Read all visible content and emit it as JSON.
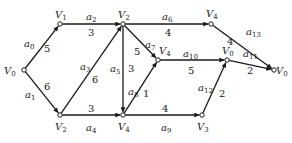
{
  "diagram": {
    "type": "directed-graph",
    "nodes": [
      {
        "id": "n0",
        "label": "V",
        "sub": "0",
        "x": 24,
        "y": 70,
        "lx": 4,
        "ly": 74
      },
      {
        "id": "n1",
        "label": "V",
        "sub": "1",
        "x": 60,
        "y": 24,
        "lx": 55,
        "ly": 18
      },
      {
        "id": "n2",
        "label": "V",
        "sub": "2",
        "x": 123,
        "y": 24,
        "lx": 118,
        "ly": 18
      },
      {
        "id": "n3",
        "label": "V",
        "sub": "4",
        "x": 211,
        "y": 24,
        "lx": 206,
        "ly": 17
      },
      {
        "id": "n4",
        "label": "V",
        "sub": "4",
        "x": 158,
        "y": 60,
        "lx": 159,
        "ly": 54
      },
      {
        "id": "n5",
        "label": "V",
        "sub": "0",
        "x": 227,
        "y": 60,
        "lx": 222,
        "ly": 54
      },
      {
        "id": "n6",
        "label": "V",
        "sub": "0",
        "x": 274,
        "y": 70,
        "lx": 276,
        "ly": 74
      },
      {
        "id": "n7",
        "label": "V",
        "sub": "2",
        "x": 60,
        "y": 115,
        "lx": 55,
        "ly": 130
      },
      {
        "id": "n8",
        "label": "V",
        "sub": "4",
        "x": 123,
        "y": 115,
        "lx": 118,
        "ly": 130
      },
      {
        "id": "n9",
        "label": "V",
        "sub": "3",
        "x": 202,
        "y": 115,
        "lx": 197,
        "ly": 130
      }
    ],
    "edges": [
      {
        "name": "a",
        "sub": "0",
        "weight": "5",
        "from": "n0",
        "to": "n1",
        "nx": 24,
        "ny": 47,
        "wx": 44,
        "wy": 52
      },
      {
        "name": "a",
        "sub": "1",
        "weight": "6",
        "from": "n0",
        "to": "n7",
        "nx": 25,
        "ny": 98,
        "wx": 44,
        "wy": 90
      },
      {
        "name": "a",
        "sub": "2",
        "weight": "3",
        "from": "n1",
        "to": "n2",
        "nx": 86,
        "ny": 20,
        "wx": 88,
        "wy": 36
      },
      {
        "name": "a",
        "sub": "3",
        "weight": "6",
        "from": "n7",
        "to": "n2",
        "nx": 80,
        "ny": 70,
        "wx": 92,
        "wy": 83
      },
      {
        "name": "a",
        "sub": "4",
        "weight": "3",
        "from": "n7",
        "to": "n8",
        "nx": 86,
        "ny": 131,
        "wx": 88,
        "wy": 112
      },
      {
        "name": "a",
        "sub": "5",
        "weight": "3",
        "from": "n2",
        "to": "n8",
        "nx": 110,
        "ny": 72,
        "wx": 128,
        "wy": 72
      },
      {
        "name": "a",
        "sub": "6",
        "weight": "4",
        "from": "n2",
        "to": "n3",
        "nx": 162,
        "ny": 20,
        "wx": 165,
        "wy": 36
      },
      {
        "name": "a",
        "sub": "7",
        "weight": "5",
        "from": "n2",
        "to": "n4",
        "nx": 145,
        "ny": 48,
        "wx": 134,
        "wy": 55
      },
      {
        "name": "a",
        "sub": "8",
        "weight": "1",
        "from": "n8",
        "to": "n4",
        "nx": 128,
        "ny": 95,
        "wx": 143,
        "wy": 97
      },
      {
        "name": "a",
        "sub": "9",
        "weight": "4",
        "from": "n8",
        "to": "n9",
        "nx": 161,
        "ny": 131,
        "wx": 162,
        "wy": 112
      },
      {
        "name": "a",
        "sub": "10",
        "weight": "5",
        "from": "n4",
        "to": "n5",
        "nx": 183,
        "ny": 57,
        "wx": 188,
        "wy": 74
      },
      {
        "name": "a",
        "sub": "11",
        "weight": "2",
        "from": "n5",
        "to": "n6",
        "nx": 243,
        "ny": 57,
        "wx": 247,
        "wy": 74
      },
      {
        "name": "a",
        "sub": "12",
        "weight": "2",
        "from": "n9",
        "to": "n5",
        "nx": 198,
        "ny": 91,
        "wx": 219,
        "wy": 97
      },
      {
        "name": "a",
        "sub": "13",
        "weight": "4",
        "from": "n3",
        "to": "n6",
        "nx": 246,
        "ny": 35,
        "wx": 227,
        "wy": 45
      }
    ]
  }
}
